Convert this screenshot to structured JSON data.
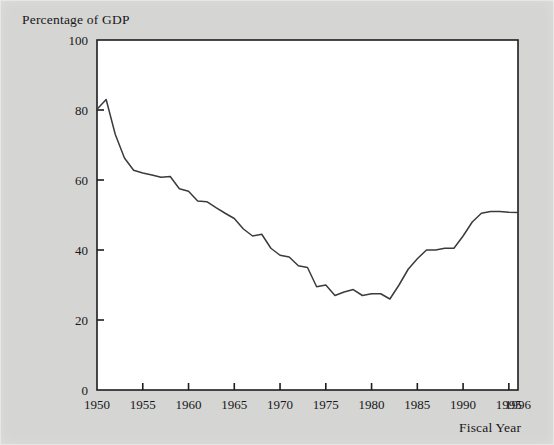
{
  "chart_data": {
    "type": "line",
    "title": "",
    "ylabel": "Percentage of GDP",
    "xlabel": "Fiscal Year",
    "xlim": [
      1950,
      1996
    ],
    "ylim": [
      0,
      100
    ],
    "grid": false,
    "legend": null,
    "xticks": [
      1950,
      1955,
      1960,
      1965,
      1970,
      1975,
      1980,
      1985,
      1990,
      1995,
      1996
    ],
    "xtick_labels": [
      "1950",
      "1955",
      "1960",
      "1965",
      "1970",
      "1975",
      "1980",
      "1985",
      "1990",
      "1995",
      "1996"
    ],
    "yticks": [
      0,
      20,
      40,
      60,
      80,
      100
    ],
    "ytick_labels": [
      "0",
      "20",
      "40",
      "60",
      "80",
      "100"
    ],
    "series": [
      {
        "name": "Federal debt held by the public",
        "color": "#3b3b3f",
        "x": [
          1950,
          1951,
          1952,
          1953,
          1954,
          1955,
          1956,
          1957,
          1958,
          1959,
          1960,
          1961,
          1962,
          1963,
          1964,
          1965,
          1966,
          1967,
          1968,
          1969,
          1970,
          1971,
          1972,
          1973,
          1974,
          1975,
          1976,
          1977,
          1978,
          1979,
          1980,
          1981,
          1982,
          1983,
          1984,
          1985,
          1986,
          1987,
          1988,
          1989,
          1990,
          1991,
          1992,
          1993,
          1994,
          1995,
          1996
        ],
        "values": [
          80.2,
          83.0,
          73.0,
          66.3,
          62.8,
          62.0,
          61.4,
          60.8,
          61.0,
          57.5,
          56.8,
          54.0,
          53.8,
          52.1,
          50.5,
          49.0,
          46.0,
          44.0,
          44.5,
          40.5,
          38.5,
          38.0,
          35.5,
          35.0,
          29.5,
          30.0,
          27.0,
          28.0,
          28.7,
          27.0,
          27.5,
          27.5,
          26.0,
          30.0,
          34.5,
          37.5,
          40.0,
          40.0,
          40.5,
          40.5,
          44.0,
          48.0,
          50.5,
          51.0,
          51.0,
          50.8,
          50.7
        ]
      }
    ]
  },
  "labels": {
    "y_axis_title": "Percentage of GDP",
    "x_axis_title": "Fiscal Year"
  }
}
